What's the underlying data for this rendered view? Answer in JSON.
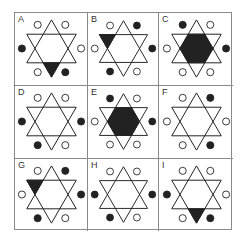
{
  "puzzle": {
    "colors": {
      "ink": "#222222",
      "grid": "#8a8a8a",
      "background": "#ffffff"
    },
    "cells": [
      {
        "label": "A",
        "fill": "bottom-triangle",
        "circles": {
          "tl": "open",
          "tr": "open",
          "r": "open",
          "br": "filled",
          "bl": "open",
          "l": "filled"
        }
      },
      {
        "label": "B",
        "fill": "top-left-triangle",
        "circles": {
          "tl": "open",
          "tr": "filled",
          "r": "filled",
          "br": "open",
          "bl": "filled",
          "l": "open"
        }
      },
      {
        "label": "C",
        "fill": "hexagon",
        "circles": {
          "tl": "filled",
          "tr": "open",
          "r": "filled",
          "br": "open",
          "bl": "open",
          "l": "open"
        }
      },
      {
        "label": "D",
        "fill": "none",
        "circles": {
          "tl": "open",
          "tr": "open",
          "r": "filled",
          "br": "open",
          "bl": "filled",
          "l": "filled"
        }
      },
      {
        "label": "E",
        "fill": "hexagon",
        "circles": {
          "tl": "filled",
          "tr": "open",
          "r": "filled",
          "br": "open",
          "bl": "open",
          "l": "open"
        }
      },
      {
        "label": "F",
        "fill": "none",
        "circles": {
          "tl": "open",
          "tr": "filled",
          "r": "open",
          "br": "filled",
          "bl": "open",
          "l": "open"
        }
      },
      {
        "label": "G",
        "fill": "top-left-triangle",
        "circles": {
          "tl": "open",
          "tr": "filled",
          "r": "filled",
          "br": "open",
          "bl": "filled",
          "l": "open"
        }
      },
      {
        "label": "H",
        "fill": "none",
        "circles": {
          "tl": "open",
          "tr": "open",
          "r": "filled",
          "br": "open",
          "bl": "filled",
          "l": "filled"
        }
      },
      {
        "label": "I",
        "fill": "bottom-triangle",
        "circles": {
          "tl": "open",
          "tr": "open",
          "r": "open",
          "br": "filled",
          "bl": "open",
          "l": "filled"
        }
      }
    ]
  }
}
